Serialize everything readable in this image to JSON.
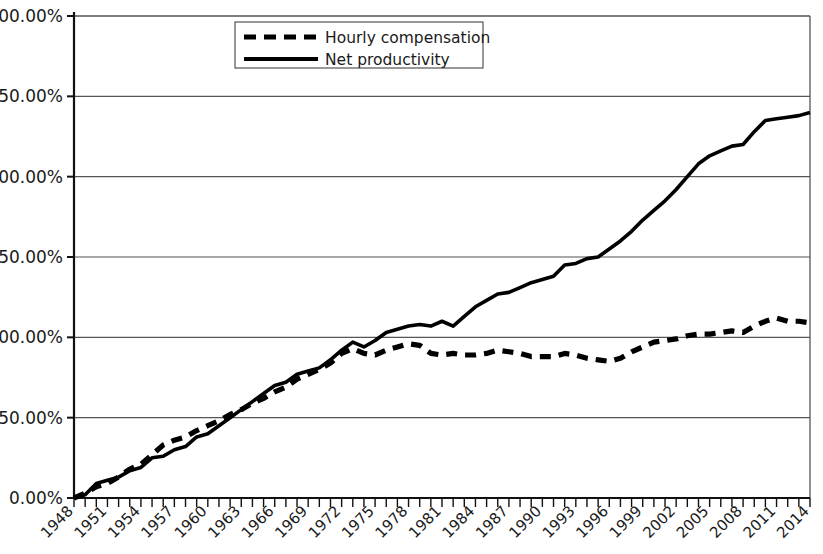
{
  "chart_data": {
    "type": "line",
    "title": "",
    "subtitle": "",
    "xlabel": "",
    "ylabel": "",
    "xlim": [
      1948,
      2014
    ],
    "ylim": [
      0,
      300
    ],
    "y_tick_format": "percent",
    "grid": "horizontal",
    "legend_position": "top-center",
    "y_ticks": [
      "0.00%",
      "50.00%",
      "100.00%",
      "150.00%",
      "200.00%",
      "250.00%",
      "300.00%"
    ],
    "y_tick_values": [
      0,
      50,
      100,
      150,
      200,
      250,
      300
    ],
    "x_ticks": [
      "1948",
      "1951",
      "1954",
      "1957",
      "1960",
      "1963",
      "1966",
      "1969",
      "1972",
      "1975",
      "1978",
      "1981",
      "1984",
      "1987",
      "1990",
      "1993",
      "1996",
      "1999",
      "2002",
      "2005",
      "2008",
      "2011",
      "2014"
    ],
    "x_tick_values": [
      1948,
      1951,
      1954,
      1957,
      1960,
      1963,
      1966,
      1969,
      1972,
      1975,
      1978,
      1981,
      1984,
      1987,
      1990,
      1993,
      1996,
      1999,
      2002,
      2005,
      2008,
      2011,
      2014
    ],
    "x_minor_tick_interval": 1,
    "x": [
      1948,
      1949,
      1950,
      1951,
      1952,
      1953,
      1954,
      1955,
      1956,
      1957,
      1958,
      1959,
      1960,
      1961,
      1962,
      1963,
      1964,
      1965,
      1966,
      1967,
      1968,
      1969,
      1970,
      1971,
      1972,
      1973,
      1974,
      1975,
      1976,
      1977,
      1978,
      1979,
      1980,
      1981,
      1982,
      1983,
      1984,
      1985,
      1986,
      1987,
      1988,
      1989,
      1990,
      1991,
      1992,
      1993,
      1994,
      1995,
      1996,
      1997,
      1998,
      1999,
      2000,
      2001,
      2002,
      2003,
      2004,
      2005,
      2006,
      2007,
      2008,
      2009,
      2010,
      2011,
      2012,
      2013,
      2014
    ],
    "series": [
      {
        "name": "Hourly compensation",
        "style": "dashed",
        "color": "#000000",
        "values": [
          0,
          3,
          7,
          9,
          13,
          18,
          21,
          27,
          33,
          36,
          38,
          42,
          45,
          48,
          52,
          55,
          59,
          62,
          66,
          69,
          74,
          77,
          80,
          84,
          90,
          93,
          90,
          89,
          92,
          94,
          96,
          95,
          90,
          89,
          90,
          89,
          89,
          90,
          92,
          91,
          90,
          88,
          88,
          88,
          90,
          89,
          87,
          86,
          85,
          87,
          91,
          94,
          97,
          98,
          99,
          101,
          102,
          102,
          103,
          104,
          103,
          107,
          110,
          112,
          110,
          110,
          109
        ]
      },
      {
        "name": "Net productivity",
        "style": "solid",
        "color": "#000000",
        "values": [
          0,
          2,
          9,
          11,
          13,
          17,
          19,
          25,
          26,
          30,
          32,
          38,
          40,
          45,
          50,
          55,
          60,
          65,
          70,
          72,
          77,
          79,
          81,
          86,
          92,
          97,
          94,
          98,
          103,
          105,
          107,
          108,
          107,
          110,
          107,
          113,
          119,
          123,
          127,
          128,
          131,
          134,
          136,
          138,
          145,
          146,
          149,
          150,
          155,
          160,
          166,
          173,
          179,
          185,
          192,
          200,
          208,
          213,
          216,
          219,
          220,
          228,
          235,
          236,
          237,
          238,
          240
        ]
      }
    ],
    "annotations": []
  },
  "legend": {
    "items": [
      {
        "label": "Hourly compensation",
        "style": "dashed"
      },
      {
        "label": "Net productivity",
        "style": "solid"
      }
    ]
  }
}
